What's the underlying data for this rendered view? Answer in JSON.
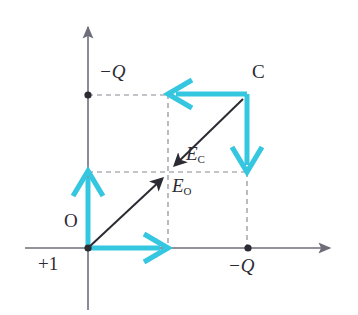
{
  "figure": {
    "background_color": "#ffffff",
    "axis_color": "#6e6e78",
    "dashed_color": "#8a8a92",
    "vector_color": "#2b2b33",
    "component_color": "#35c6e0",
    "point_color": "#2b2b33"
  },
  "axes": {
    "x_axis": {
      "x1": 25,
      "y1": 248,
      "x2": 335,
      "y2": 248,
      "arrow": "right"
    },
    "y_axis": {
      "x1": 88,
      "y1": 310,
      "x2": 88,
      "y2": 22,
      "arrow": "up"
    },
    "origin": {
      "x": 88,
      "y": 248
    }
  },
  "labels": {
    "origin_label": "O",
    "test_charge_label": "+1",
    "charge_y_label": "−Q",
    "charge_x_label": "−Q",
    "corner_label": "C",
    "field_c_symbol": "E",
    "field_c_subscript": "C",
    "field_o_symbol": "E",
    "field_o_subscript": "O"
  },
  "points": [
    {
      "name": "origin",
      "label": "O",
      "x": 88,
      "y": 248,
      "marker": true
    },
    {
      "name": "charge-on-y-axis",
      "label": "−Q",
      "x": 88,
      "y": 95,
      "marker": true
    },
    {
      "name": "charge-on-x-axis",
      "label": "−Q",
      "x": 248,
      "y": 248,
      "marker": true
    },
    {
      "name": "corner-point-c",
      "label": "C",
      "x": 247,
      "y": 94,
      "marker": false
    }
  ],
  "dashed_lines": [
    {
      "name": "top-horizontal",
      "x1": 88,
      "y1": 95,
      "x2": 247,
      "y2": 95
    },
    {
      "name": "mid-horizontal",
      "x1": 88,
      "y1": 172,
      "x2": 248,
      "y2": 172
    },
    {
      "name": "mid-vertical",
      "x1": 168,
      "y1": 94,
      "x2": 168,
      "y2": 248
    },
    {
      "name": "right-vertical",
      "x1": 247,
      "y1": 172,
      "x2": 247,
      "y2": 248
    }
  ],
  "component_vectors": [
    {
      "name": "field-at-o-vertical-component",
      "x1": 88,
      "y1": 248,
      "x2": 88,
      "y2": 172,
      "direction": "up"
    },
    {
      "name": "field-at-o-horizontal-component",
      "x1": 88,
      "y1": 248,
      "x2": 168,
      "y2": 248,
      "direction": "right"
    },
    {
      "name": "field-at-c-horizontal-component",
      "x1": 247,
      "y1": 94,
      "x2": 168,
      "y2": 94,
      "direction": "left"
    },
    {
      "name": "field-at-c-vertical-component",
      "x1": 247,
      "y1": 94,
      "x2": 247,
      "y2": 172,
      "direction": "down"
    }
  ],
  "resultant_vectors": [
    {
      "name": "field-at-o-resultant",
      "label": "E_O",
      "x1": 88,
      "y1": 248,
      "x2": 166,
      "y2": 175
    },
    {
      "name": "field-at-c-resultant",
      "label": "E_C",
      "x1": 243,
      "y1": 99,
      "x2": 171,
      "y2": 169
    }
  ],
  "label_positions": {
    "origin_label": {
      "x": 64,
      "y": 219
    },
    "test_charge_label": {
      "x": 38,
      "y": 256
    },
    "charge_y_label": {
      "x": 99,
      "y": 62
    },
    "charge_x_label": {
      "x": 228,
      "y": 256
    },
    "corner_label": {
      "x": 252,
      "y": 62
    },
    "field_c_label": {
      "x": 186,
      "y": 147
    },
    "field_o_label": {
      "x": 172,
      "y": 178
    }
  }
}
